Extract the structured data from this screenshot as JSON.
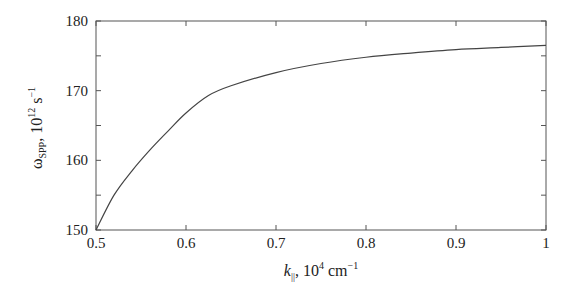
{
  "chart_data": {
    "type": "line",
    "title": "",
    "xlabel": "k_||, 10^4 cm^-1",
    "ylabel": "ω_SPP, 10^12 s^-1",
    "xlabel_parts": {
      "symbol": "k",
      "subscript": "||",
      "rest": ", 10",
      "exp": "4",
      "unit": " cm",
      "unit_exp": "−1"
    },
    "ylabel_parts": {
      "symbol": "ω",
      "subscript": "SPP",
      "rest": ", 10",
      "exp": "12",
      "unit": " s",
      "unit_exp": "−1"
    },
    "xlim": [
      0.5,
      1.0
    ],
    "ylim": [
      150,
      180
    ],
    "x_ticks": [
      0.5,
      0.6,
      0.7,
      0.8,
      0.9,
      1.0
    ],
    "x_tick_labels": [
      "0.5",
      "0.6",
      "0.7",
      "0.8",
      "0.9",
      "1"
    ],
    "y_ticks": [
      150,
      160,
      170,
      180
    ],
    "y_tick_labels": [
      "150",
      "160",
      "170",
      "180"
    ],
    "y_minor_ticks": [
      155,
      165,
      175
    ],
    "grid": false,
    "legend": null,
    "series": [
      {
        "name": "ω_SPP(k_||)",
        "color": "#444444",
        "x": [
          0.5,
          0.52,
          0.54,
          0.56,
          0.58,
          0.6,
          0.625,
          0.65,
          0.7,
          0.75,
          0.8,
          0.85,
          0.9,
          0.95,
          1.0
        ],
        "y": [
          150.0,
          155.0,
          158.5,
          161.5,
          164.2,
          166.8,
          169.3,
          170.7,
          172.6,
          173.9,
          174.8,
          175.4,
          175.9,
          176.2,
          176.5
        ]
      }
    ]
  },
  "style": {
    "axis_color": "#555555",
    "line_color": "#444444",
    "text_color": "#222222",
    "background": "#ffffff"
  }
}
